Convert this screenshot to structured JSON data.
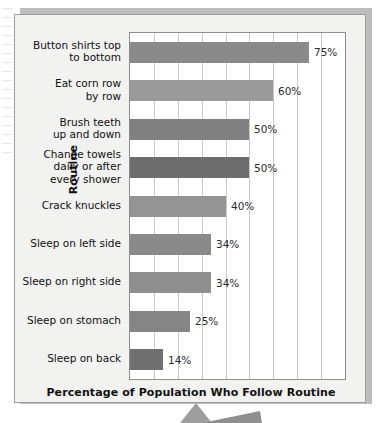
{
  "chart_data": {
    "type": "bar",
    "orientation": "horizontal",
    "title": "",
    "xlabel": "Percentage of Population Who Follow Routine",
    "ylabel": "Routine",
    "xlim": [
      0,
      90
    ],
    "grid": true,
    "gridline_count": 9,
    "legend": "none",
    "categories": [
      "Button shirts top\nto bottom",
      "Eat corn row\nby row",
      "Brush teeth\nup and down",
      "Change towels\ndaily or after\nevery shower",
      "Crack knuckles",
      "Sleep on left side",
      "Sleep on right side",
      "Sleep on stomach",
      "Sleep on back"
    ],
    "values": [
      75,
      60,
      50,
      50,
      40,
      34,
      34,
      25,
      14
    ],
    "value_labels": [
      "75%",
      "60%",
      "50%",
      "50%",
      "40%",
      "34%",
      "34%",
      "25%",
      "14%"
    ],
    "bar_colors": [
      "#8a8a8a",
      "#9a9a9a",
      "#808080",
      "#6d6d6d",
      "#949494",
      "#8a8a8a",
      "#8f8f8f",
      "#858585",
      "#707070"
    ]
  },
  "chart": {
    "frame_background": "#f2f2f0",
    "plot_background": "#ffffff",
    "gridline_color": "#c9c9c9",
    "axis_color": "#8d8d8d",
    "text_color": "#111111"
  }
}
